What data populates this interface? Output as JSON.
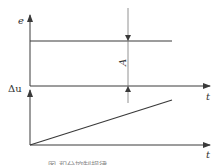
{
  "diagram": {
    "top_plot": {
      "y_axis_label": "e",
      "x_axis_label": "t",
      "signal": "step (constant deviation)"
    },
    "bottom_plot": {
      "y_axis_label": "Δu",
      "x_axis_label": "t",
      "signal": "ramp (linearly increasing output)"
    },
    "amplitude_label": "A",
    "caption": "图    积分控制规律"
  },
  "colors": {
    "line": "#3a3a3a",
    "background": "#ffffff"
  }
}
